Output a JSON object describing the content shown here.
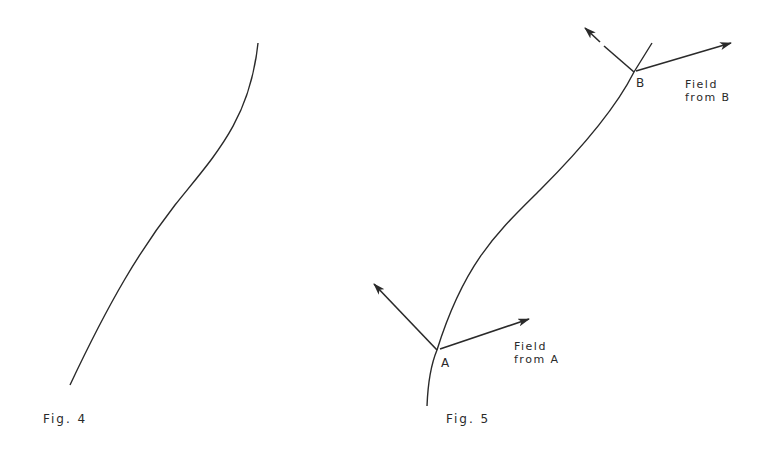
{
  "figures": [
    {
      "id": "fig4",
      "caption": "Fig. 4",
      "description": "S-shaped curve (line)"
    },
    {
      "id": "fig5",
      "caption": "Fig. 5",
      "description": "Curve with points A and B, each showing a normal arrow and a field arrow",
      "points": [
        {
          "label": "A",
          "field_label_line1": "Field",
          "field_label_line2": "from A"
        },
        {
          "label": "B",
          "field_label_line1": "Field",
          "field_label_line2": "from B"
        }
      ]
    }
  ],
  "colors": {
    "ink": "#2a2a2a",
    "background": "#ffffff"
  }
}
